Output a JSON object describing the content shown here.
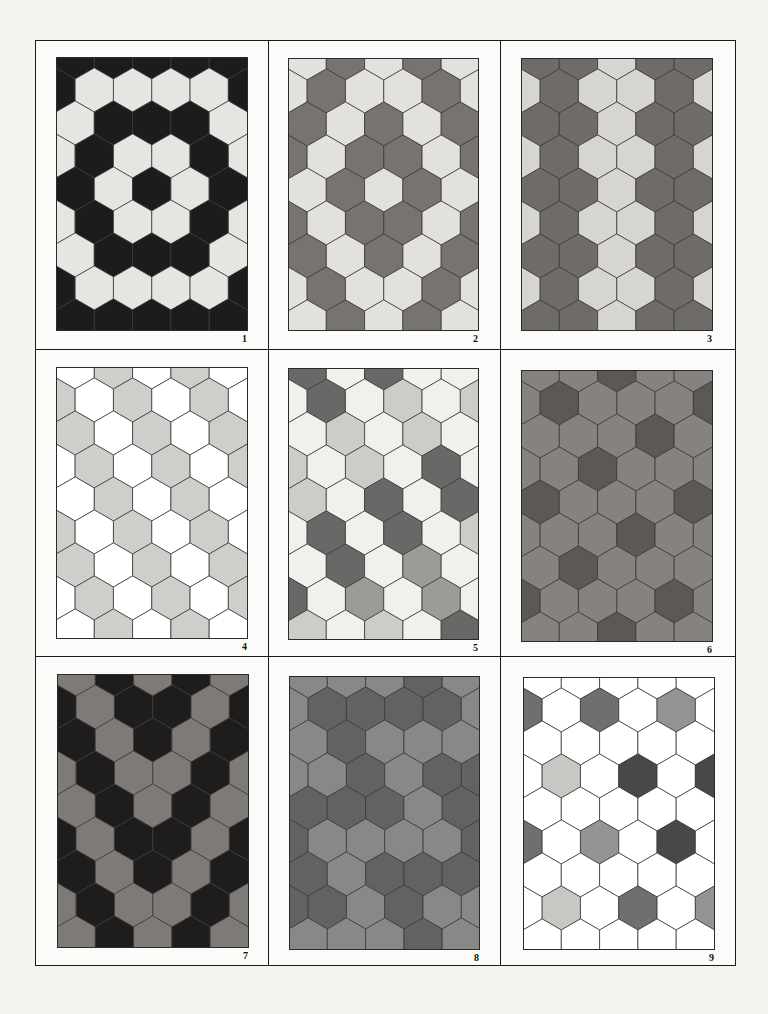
{
  "page": {
    "background": "#f4f3f0"
  },
  "panels": [
    {
      "number": "1",
      "box": {
        "x": 56,
        "y": 57,
        "w": 192,
        "h": 274
      },
      "palette": {
        "L": "#e6e5e1",
        "K": "#1c1c1c"
      },
      "rows": [
        "KKKKK",
        "KLLLLK",
        "LKKKL",
        "LKLLKL",
        "KLKLK",
        "LKLLKL",
        "LKKKL",
        "KLLLLK",
        "KKKKK"
      ]
    },
    {
      "number": "2",
      "box": {
        "x": 288,
        "y": 58,
        "w": 191,
        "h": 273
      },
      "palette": {
        "L": "#e2e1dd",
        "D": "#767370"
      },
      "rows": [
        "LDLDL",
        "LDLLDL",
        "DLDLD",
        "DLDDLD",
        "LDLDL",
        "DLDDLD",
        "DLDLD",
        "LDLLDL",
        "LDLDL"
      ]
    },
    {
      "number": "3",
      "box": {
        "x": 521,
        "y": 58,
        "w": 192,
        "h": 273
      },
      "palette": {
        "L": "#d6d5d1",
        "D": "#6e6b68"
      },
      "rows": [
        "DDLDD",
        "LDLLDL",
        "DDLDD",
        "LDLLDL",
        "DDLDD",
        "LDLLDL",
        "DDLDD",
        "LDLLDL",
        "DDLDD"
      ]
    },
    {
      "number": "4",
      "box": {
        "x": 56,
        "y": 367,
        "w": 192,
        "h": 272
      },
      "palette": {
        "W": "#ffffff",
        "G": "#cfcecb"
      },
      "rows": [
        "WGWGW",
        "GWGWGW",
        "GWGWG",
        "WGWGWG",
        "WGWGW",
        "GWGWGW",
        "GWGWG",
        "WGWGWG",
        "WGWGW"
      ]
    },
    {
      "number": "5",
      "box": {
        "x": 288,
        "y": 368,
        "w": 191,
        "h": 272
      },
      "palette": {
        "W": "#f1f0ed",
        "L": "#cdccc9",
        "M": "#9d9b98",
        "D": "#6a6866"
      },
      "rows": [
        "DWDWW",
        "WDWLWL",
        "WLWLW",
        "LWLWDW",
        "LWDWD",
        "WDWDWL",
        "WDWMW",
        "DWMWMW",
        "LWLWD"
      ]
    },
    {
      "number": "6",
      "box": {
        "x": 521,
        "y": 370,
        "w": 192,
        "h": 272
      },
      "palette": {
        "M": "#858280",
        "D": "#5b5856"
      },
      "rows": [
        "MMDMM",
        "MDMMMD",
        "MMMDM",
        "MMDMMM",
        "DMMMD",
        "MMMDMM",
        "MDMMM",
        "DMMMDM",
        "MMDMM"
      ]
    },
    {
      "number": "7",
      "box": {
        "x": 57,
        "y": 674,
        "w": 192,
        "h": 274
      },
      "palette": {
        "M": "#7d7a78",
        "K": "#1f1d1c"
      },
      "rows": [
        "MKMKM",
        "KMKKMK",
        "KMKMK",
        "MKMMKM",
        "MKMKM",
        "KMKKMK",
        "KMKMK",
        "MKMMKM",
        "MKMKM"
      ]
    },
    {
      "number": "8",
      "box": {
        "x": 289,
        "y": 676,
        "w": 191,
        "h": 274
      },
      "palette": {
        "M": "#8a8886",
        "D": "#646260"
      },
      "rows": [
        "MMMDM",
        "MDDDDM",
        "MDMMM",
        "MMDMDD",
        "DDDMD",
        "DMMMMD",
        "DMDDD",
        "DDMDMM",
        "MMMDM"
      ]
    },
    {
      "number": "9",
      "box": {
        "x": 523,
        "y": 677,
        "w": 192,
        "h": 273
      },
      "palette": {
        "W": "#ffffff",
        "L": "#c8c7c4",
        "M": "#969492",
        "D": "#716f6d",
        "K": "#4a4847"
      },
      "rows": [
        "WWWWW",
        "DWDWMW",
        "WWWWW",
        "WLWKWK",
        "WWWWW",
        "DWMWKW",
        "WWWWW",
        "WLWDWM",
        "WWWWW"
      ]
    }
  ],
  "hex": {
    "width": 38.3,
    "row_step": 33,
    "edge_color": "#3a3938"
  }
}
